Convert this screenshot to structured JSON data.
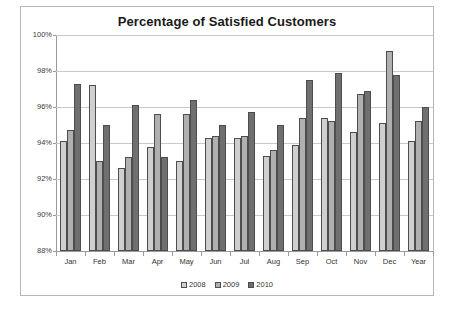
{
  "chart_data": {
    "type": "bar",
    "title": "Percentage of Satisfied Customers",
    "xlabel": "",
    "ylabel": "",
    "ylim": [
      88,
      100
    ],
    "ytick_labels": [
      "100%",
      "98%",
      "96%",
      "94%",
      "92%",
      "90%",
      "88%"
    ],
    "ytick_values": [
      100,
      98,
      96,
      94,
      92,
      90,
      88
    ],
    "grid": true,
    "legend_position": "bottom",
    "categories": [
      "Jan",
      "Feb",
      "Mar",
      "Apr",
      "May",
      "Jun",
      "Jul",
      "Aug",
      "Sep",
      "Oct",
      "Nov",
      "Dec",
      "Year"
    ],
    "series": [
      {
        "name": "2008",
        "color": "#cfcfcf",
        "values": [
          94.1,
          97.2,
          92.6,
          93.8,
          93.0,
          94.3,
          94.3,
          93.3,
          93.9,
          95.4,
          94.6,
          95.1,
          94.1
        ]
      },
      {
        "name": "2009",
        "color": "#b0b0b0",
        "values": [
          94.7,
          93.0,
          93.2,
          95.6,
          95.6,
          94.4,
          94.4,
          93.6,
          95.4,
          95.2,
          96.7,
          99.1,
          95.2
        ]
      },
      {
        "name": "2010",
        "color": "#6f6f6f",
        "values": [
          97.3,
          95.0,
          96.1,
          93.2,
          96.4,
          95.0,
          95.7,
          95.0,
          97.5,
          97.9,
          96.9,
          97.8,
          96.0
        ]
      }
    ]
  },
  "legend": {
    "items": [
      {
        "label": "2008"
      },
      {
        "label": "2009"
      },
      {
        "label": "2010"
      }
    ]
  }
}
